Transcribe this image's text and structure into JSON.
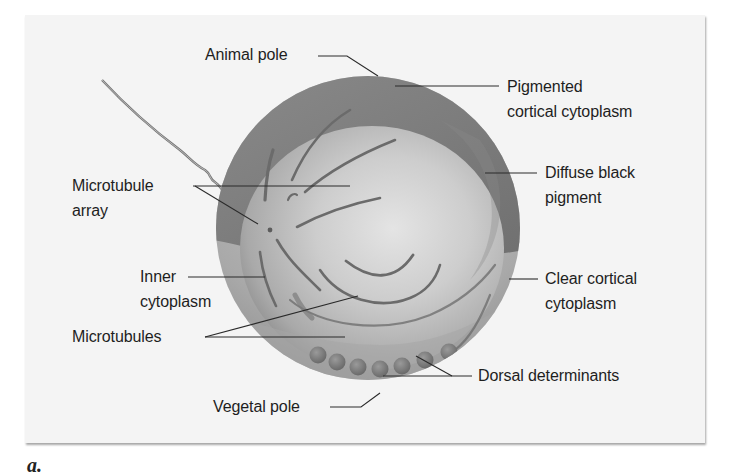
{
  "figure": {
    "panel_label": "a.",
    "labels": {
      "animal_pole": "Animal pole",
      "pigmented_cortical_cytoplasm": [
        "Pigmented",
        "cortical cytoplasm"
      ],
      "diffuse_black_pigment": [
        "Diffuse black",
        "pigment"
      ],
      "microtubule_array": [
        "Microtubule",
        "array"
      ],
      "inner_cytoplasm": [
        "Inner",
        "cytoplasm"
      ],
      "clear_cortical_cytoplasm": [
        "Clear cortical",
        "cytoplasm"
      ],
      "microtubules": "Microtubules",
      "dorsal_determinants": "Dorsal determinants",
      "vegetal_pole": "Vegetal pole"
    },
    "colors": {
      "panel_background": "#f4f4f4",
      "pigmented_cortex": "#7d7d7d",
      "inner_cytoplasm": "#bdbdbd",
      "clear_cortex": "#a8a8a8",
      "microtubule": "#6a6a6a",
      "leader_line": "#2a2a2a",
      "text": "#1e1e1e"
    }
  }
}
